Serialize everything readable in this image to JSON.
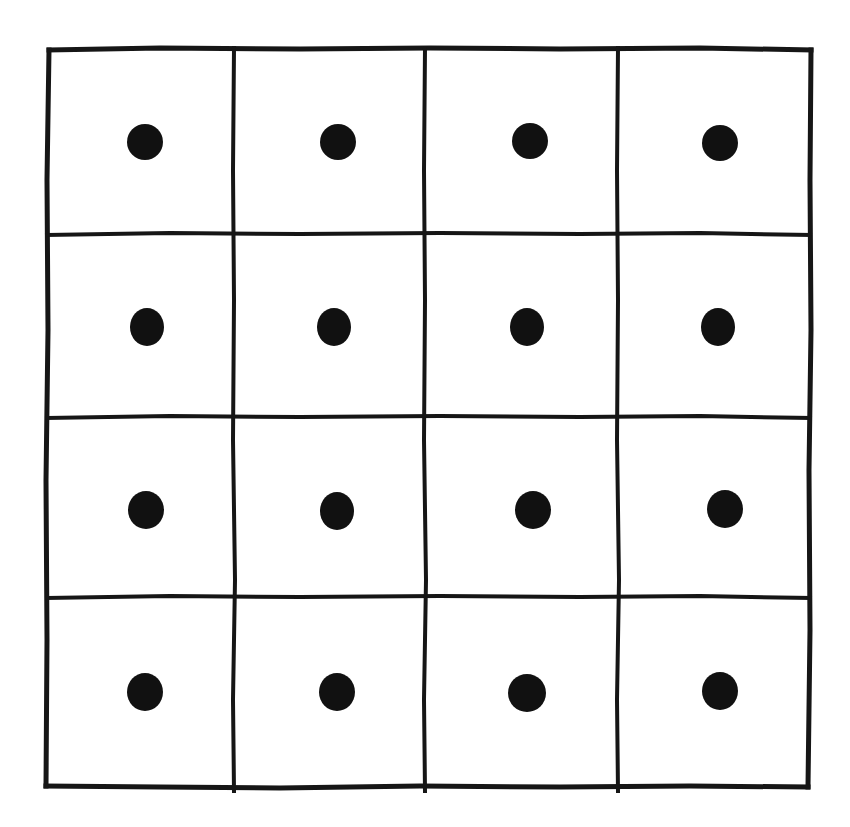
{
  "figure": {
    "name": "four-by-four-grid-of-dots",
    "description": "Hand-drawn square grid of 4 rows by 4 columns with one filled black dot in each cell",
    "background_color": "#ffffff",
    "line_color": "#161616",
    "dot_color": "#111111",
    "rows": 4,
    "columns": 4,
    "total_cells": 16,
    "total_dots": 16,
    "dots_per_cell": 1,
    "canvas": {
      "width": 850,
      "height": 827
    }
  },
  "grid_geometry": {
    "outer_left": 48,
    "outer_top": 48,
    "outer_right": 811,
    "outer_bottom": 787,
    "vertical_line_x": [
      48,
      234,
      425,
      618,
      811
    ],
    "horizontal_line_y": [
      48,
      234,
      417,
      597,
      787
    ],
    "outer_stroke_width": 5,
    "inner_stroke_width": 4
  },
  "chart_data": {
    "type": "scatter",
    "title": "",
    "subtitle": "",
    "xlabel": "",
    "ylabel": "",
    "grid": true,
    "legend": "none",
    "xlim": [
      48,
      811
    ],
    "ylim": [
      48,
      787
    ],
    "categories": [
      "column 1",
      "column 2",
      "column 3",
      "column 4"
    ],
    "row_labels": [
      "row 1",
      "row 2",
      "row 3",
      "row 4"
    ],
    "marker": "filled-circle",
    "marker_color": "#111111",
    "series": [
      {
        "name": "row 1",
        "values": [
          1,
          1,
          1,
          1
        ],
        "points": [
          {
            "cell": "r1c1",
            "cx": 145,
            "cy": 142,
            "rx": 18,
            "ry": 18
          },
          {
            "cell": "r1c2",
            "cx": 338,
            "cy": 142,
            "rx": 18,
            "ry": 18
          },
          {
            "cell": "r1c3",
            "cx": 530,
            "cy": 141,
            "rx": 18,
            "ry": 18
          },
          {
            "cell": "r1c4",
            "cx": 720,
            "cy": 143,
            "rx": 18,
            "ry": 18
          }
        ]
      },
      {
        "name": "row 2",
        "values": [
          1,
          1,
          1,
          1
        ],
        "points": [
          {
            "cell": "r2c1",
            "cx": 147,
            "cy": 327,
            "rx": 17,
            "ry": 19
          },
          {
            "cell": "r2c2",
            "cx": 334,
            "cy": 327,
            "rx": 17,
            "ry": 19
          },
          {
            "cell": "r2c3",
            "cx": 527,
            "cy": 327,
            "rx": 17,
            "ry": 19
          },
          {
            "cell": "r2c4",
            "cx": 718,
            "cy": 327,
            "rx": 17,
            "ry": 19
          }
        ]
      },
      {
        "name": "row 3",
        "values": [
          1,
          1,
          1,
          1
        ],
        "points": [
          {
            "cell": "r3c1",
            "cx": 146,
            "cy": 510,
            "rx": 18,
            "ry": 19
          },
          {
            "cell": "r3c2",
            "cx": 337,
            "cy": 511,
            "rx": 17,
            "ry": 19
          },
          {
            "cell": "r3c3",
            "cx": 533,
            "cy": 510,
            "rx": 18,
            "ry": 19
          },
          {
            "cell": "r3c4",
            "cx": 725,
            "cy": 509,
            "rx": 18,
            "ry": 19
          }
        ]
      },
      {
        "name": "row 4",
        "values": [
          1,
          1,
          1,
          1
        ],
        "points": [
          {
            "cell": "r4c1",
            "cx": 145,
            "cy": 692,
            "rx": 18,
            "ry": 19
          },
          {
            "cell": "r4c2",
            "cx": 337,
            "cy": 692,
            "rx": 18,
            "ry": 19
          },
          {
            "cell": "r4c3",
            "cx": 527,
            "cy": 693,
            "rx": 19,
            "ry": 19
          },
          {
            "cell": "r4c4",
            "cx": 720,
            "cy": 691,
            "rx": 18,
            "ry": 19
          }
        ]
      }
    ],
    "cell_counts": [
      [
        1,
        1,
        1,
        1
      ],
      [
        1,
        1,
        1,
        1
      ],
      [
        1,
        1,
        1,
        1
      ],
      [
        1,
        1,
        1,
        1
      ]
    ]
  }
}
